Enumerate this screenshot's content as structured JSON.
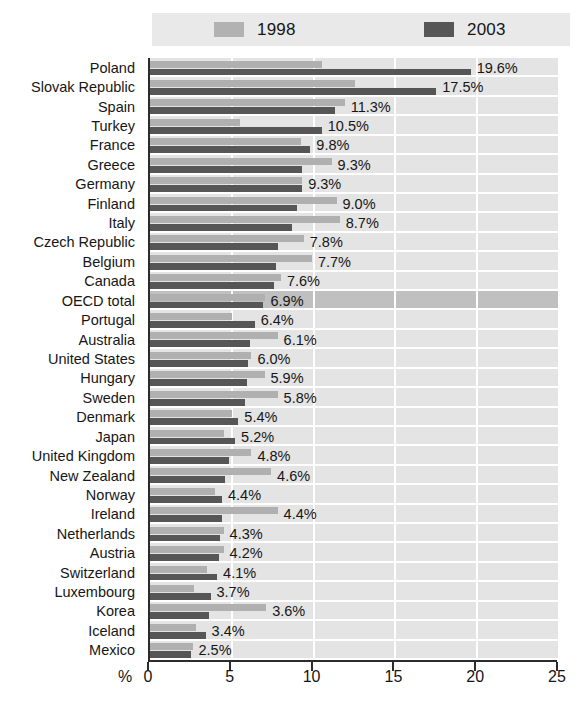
{
  "legend": {
    "entries": [
      {
        "label": "1998",
        "color": "#b2b2b2",
        "icon": "legend-swatch-1998"
      },
      {
        "label": "2003",
        "color": "#565656",
        "icon": "legend-swatch-2003"
      }
    ]
  },
  "axis": {
    "unit": "%",
    "ticks": [
      "0",
      "5",
      "10",
      "15",
      "20",
      "25"
    ],
    "min": 0,
    "max": 25
  },
  "chart_data": {
    "type": "bar",
    "orientation": "horizontal",
    "title": "",
    "subtitle": "",
    "xlabel": "%",
    "ylabel": "",
    "xlim": [
      0,
      25
    ],
    "grid": true,
    "legend_position": "top",
    "categories": [
      "Poland",
      "Slovak Republic",
      "Spain",
      "Turkey",
      "France",
      "Greece",
      "Germany",
      "Finland",
      "Italy",
      "Czech Republic",
      "Belgium",
      "Canada",
      "OECD total",
      "Portugal",
      "Australia",
      "United States",
      "Hungary",
      "Sweden",
      "Denmark",
      "Japan",
      "United Kingdom",
      "New Zealand",
      "Norway",
      "Ireland",
      "Netherlands",
      "Austria",
      "Switzerland",
      "Luxembourg",
      "Korea",
      "Iceland",
      "Mexico"
    ],
    "highlight_category": "OECD total",
    "series": [
      {
        "name": "1998",
        "color": "#b0b0b0",
        "values": [
          10.5,
          12.5,
          11.9,
          5.5,
          9.2,
          11.1,
          9.3,
          11.4,
          11.6,
          9.4,
          9.9,
          8.0,
          7.0,
          5.0,
          7.8,
          6.2,
          7.0,
          7.8,
          5.0,
          4.5,
          6.2,
          7.4,
          4.0,
          7.8,
          4.5,
          4.5,
          3.5,
          2.7,
          7.1,
          2.8,
          2.6
        ]
      },
      {
        "name": "2003",
        "color": "#565656",
        "values": [
          19.6,
          17.5,
          11.3,
          10.5,
          9.8,
          9.3,
          9.3,
          9.0,
          8.7,
          7.8,
          7.7,
          7.6,
          6.9,
          6.4,
          6.1,
          6.0,
          5.9,
          5.8,
          5.4,
          5.2,
          4.8,
          4.6,
          4.4,
          4.4,
          4.3,
          4.2,
          4.1,
          3.7,
          3.6,
          3.4,
          2.5
        ]
      }
    ],
    "data_labels": [
      "19.6%",
      "17.5%",
      "11.3%",
      "10.5%",
      "9.8%",
      "9.3%",
      "9.3%",
      "9.0%",
      "8.7%",
      "7.8%",
      "7.7%",
      "7.6%",
      "6.9%",
      "6.4%",
      "6.1%",
      "6.0%",
      "5.9%",
      "5.8%",
      "5.4%",
      "5.2%",
      "4.8%",
      "4.6%",
      "4.4%",
      "4.4%",
      "4.3%",
      "4.2%",
      "4.1%",
      "3.7%",
      "3.6%",
      "3.4%",
      "2.5%"
    ]
  }
}
